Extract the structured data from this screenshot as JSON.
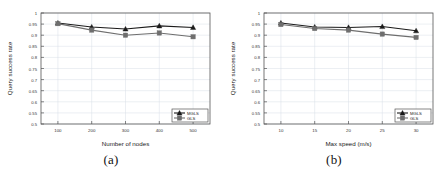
{
  "figure": {
    "panels": [
      {
        "caption": "(a)",
        "chart_data": {
          "type": "line",
          "title": "",
          "xlabel": "Number of nodes",
          "ylabel": "Query success rate",
          "x": [
            100,
            200,
            300,
            400,
            500
          ],
          "xticklabels": [
            "100",
            "200",
            "300",
            "400",
            "500"
          ],
          "xlim": [
            50,
            550
          ],
          "ylim": [
            0.5,
            1
          ],
          "yticks": [
            0.5,
            0.55,
            0.6,
            0.65,
            0.7,
            0.75,
            0.8,
            0.85,
            0.9,
            0.95,
            1
          ],
          "yticklabels": [
            "0.5",
            "0.55",
            "0.6",
            "0.65",
            "0.7",
            "0.75",
            "0.8",
            "0.85",
            "0.9",
            "0.95",
            "1"
          ],
          "grid": true,
          "legend_position": "lower right",
          "series": [
            {
              "name": "MGLS",
              "values": [
                0.955,
                0.937,
                0.928,
                0.942,
                0.935
              ],
              "color": "#1a1a1a",
              "marker": "triangle"
            },
            {
              "name": "GLS",
              "values": [
                0.952,
                0.923,
                0.9,
                0.91,
                0.893
              ],
              "color": "#6e6e6e",
              "marker": "square"
            }
          ]
        }
      },
      {
        "caption": "(b)",
        "chart_data": {
          "type": "line",
          "title": "",
          "xlabel": "Max speed (m/s)",
          "ylabel": "Query success rate",
          "x": [
            10,
            15,
            20,
            25,
            30
          ],
          "xticklabels": [
            "10",
            "15",
            "20",
            "25",
            "30"
          ],
          "xlim": [
            7.5,
            32.5
          ],
          "ylim": [
            0.5,
            1
          ],
          "yticks": [
            0.5,
            0.55,
            0.6,
            0.65,
            0.7,
            0.75,
            0.8,
            0.85,
            0.9,
            0.95,
            1
          ],
          "yticklabels": [
            "0.5",
            "0.55",
            "0.6",
            "0.65",
            "0.7",
            "0.75",
            "0.8",
            "0.85",
            "0.9",
            "0.95",
            "1"
          ],
          "grid": true,
          "legend_position": "lower right",
          "series": [
            {
              "name": "MGLS",
              "values": [
                0.955,
                0.937,
                0.935,
                0.939,
                0.92
              ],
              "color": "#1a1a1a",
              "marker": "triangle"
            },
            {
              "name": "GLS",
              "values": [
                0.948,
                0.93,
                0.923,
                0.905,
                0.89
              ],
              "color": "#6e6e6e",
              "marker": "square"
            }
          ]
        }
      }
    ]
  }
}
